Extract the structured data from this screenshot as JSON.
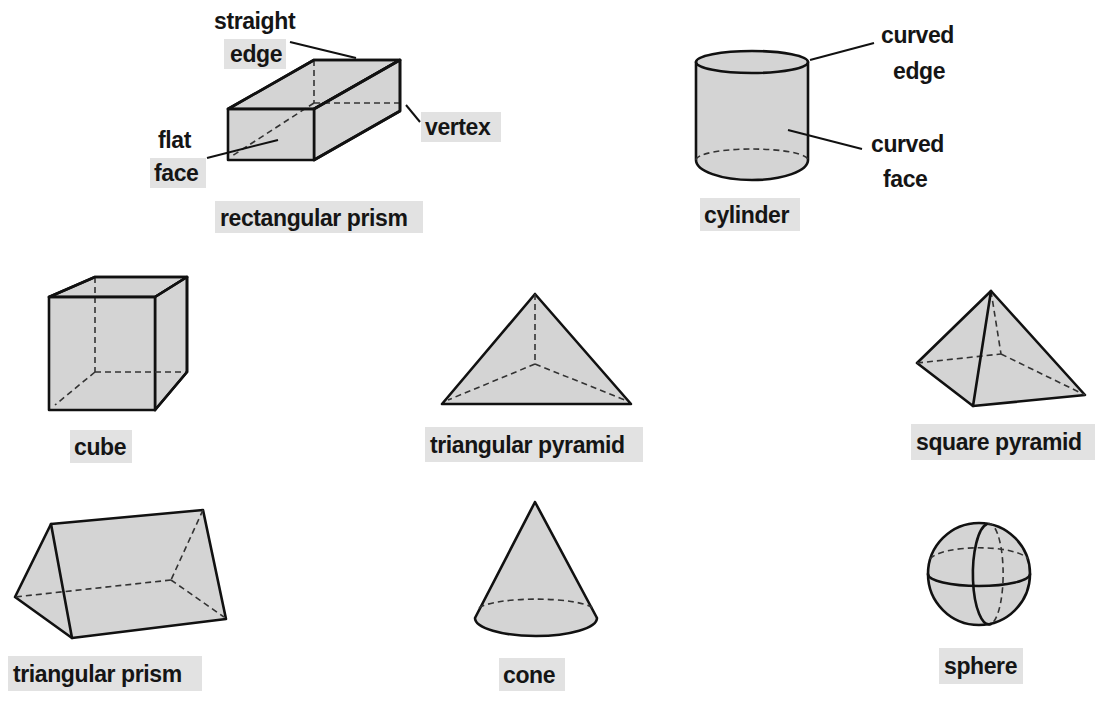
{
  "colors": {
    "shape_fill": "#d4d4d4",
    "stroke": "#111111",
    "label_bg": "#e2e2e2",
    "text": "#151515"
  },
  "annotations": {
    "straight": "straight",
    "edge": "edge",
    "flat": "flat",
    "face": "face",
    "vertex": "vertex",
    "curved_edge_1": "curved",
    "curved_edge_2": "edge",
    "curved_face_1": "curved",
    "curved_face_2": "face"
  },
  "shapes": {
    "rectangular_prism": "rectangular prism",
    "cylinder": "cylinder",
    "cube": "cube",
    "triangular_pyramid": "triangular pyramid",
    "square_pyramid": "square pyramid",
    "triangular_prism": "triangular prism",
    "cone": "cone",
    "sphere": "sphere"
  }
}
